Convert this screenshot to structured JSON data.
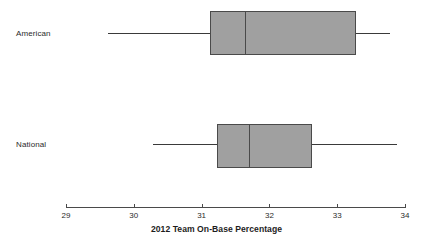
{
  "chart_data": {
    "type": "box",
    "title": "",
    "xlabel": "2012 Team On-Base Percentage",
    "ylabel": "",
    "xlim": [
      29,
      34
    ],
    "xticks": [
      29,
      30,
      31,
      32,
      33,
      34
    ],
    "xtick_labels": [
      "29",
      "30",
      "31",
      "32",
      "33",
      "34"
    ],
    "grid": false,
    "legend": "none",
    "orientation": "horizontal",
    "categories": [
      "American",
      "National"
    ],
    "boxes": [
      {
        "name": "American",
        "min": 29.62,
        "q1": 31.12,
        "median": 31.64,
        "q3": 33.28,
        "max": 33.78
      },
      {
        "name": "National",
        "min": 30.28,
        "q1": 31.23,
        "median": 31.7,
        "q3": 32.63,
        "max": 33.88
      }
    ],
    "colors": {
      "box_fill": "#a0a0a0",
      "box_stroke": "#4a4a4a",
      "axis": "#4a4a4a",
      "text": "#231f20",
      "background": "#ffffff"
    }
  },
  "axis": {
    "title": "2012 Team On-Base Percentage",
    "tick_labels": [
      "29",
      "30",
      "31",
      "32",
      "33",
      "34"
    ]
  },
  "categories": {
    "american": "American",
    "national": "National"
  }
}
